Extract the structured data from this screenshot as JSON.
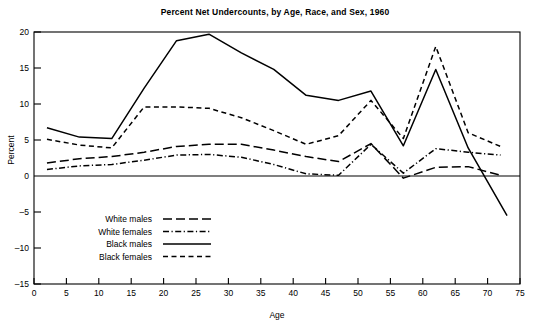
{
  "chart_data": {
    "type": "line",
    "title": "Percent Net Undercounts, by Age, Race, and Sex, 1960",
    "xlabel": "Age",
    "ylabel": "Percent",
    "xlim": [
      0,
      75
    ],
    "ylim": [
      -15,
      20
    ],
    "grid": false,
    "legend_position": "inside-lower-left",
    "xticks": [
      0,
      5,
      10,
      15,
      20,
      25,
      30,
      35,
      40,
      45,
      50,
      55,
      60,
      65,
      70,
      75
    ],
    "yticks": [
      -15,
      -10,
      -5,
      0,
      5,
      10,
      15,
      20
    ],
    "zero_line": true,
    "series": [
      {
        "name": "White males",
        "style": "long-dash",
        "x": [
          2,
          7,
          12,
          17,
          22,
          27,
          32,
          37,
          42,
          47,
          52,
          57,
          62,
          67,
          72
        ],
        "values": [
          1.8,
          2.4,
          2.7,
          3.3,
          4.1,
          4.4,
          4.4,
          3.6,
          2.7,
          2.0,
          4.5,
          -0.3,
          1.2,
          1.3,
          0.1
        ]
      },
      {
        "name": "White females",
        "style": "dash-dot",
        "x": [
          2,
          7,
          12,
          17,
          22,
          27,
          32,
          37,
          42,
          47,
          52,
          57,
          62,
          67,
          72
        ],
        "values": [
          0.9,
          1.4,
          1.6,
          2.2,
          2.9,
          3.0,
          2.6,
          1.6,
          0.3,
          0.1,
          4.4,
          0.4,
          3.8,
          3.3,
          2.9
        ]
      },
      {
        "name": "Black males",
        "style": "solid",
        "x": [
          2,
          7,
          12,
          17,
          22,
          27,
          32,
          37,
          42,
          47,
          52,
          57,
          62,
          67,
          73
        ],
        "values": [
          6.7,
          5.4,
          5.2,
          12.2,
          18.8,
          19.7,
          17.1,
          14.8,
          11.2,
          10.5,
          11.8,
          4.2,
          14.8,
          3.9,
          -5.5
        ]
      },
      {
        "name": "Black females",
        "style": "dash",
        "x": [
          2,
          7,
          12,
          17,
          22,
          27,
          32,
          37,
          42,
          47,
          52,
          57,
          62,
          67,
          72
        ],
        "values": [
          5.1,
          4.3,
          3.9,
          9.6,
          9.6,
          9.4,
          8.1,
          6.3,
          4.4,
          5.6,
          10.5,
          5.2,
          18.0,
          6.0,
          4.1
        ]
      }
    ]
  },
  "legend": {
    "items": [
      {
        "label": "White males"
      },
      {
        "label": "White females"
      },
      {
        "label": "Black males"
      },
      {
        "label": "Black females"
      }
    ]
  }
}
